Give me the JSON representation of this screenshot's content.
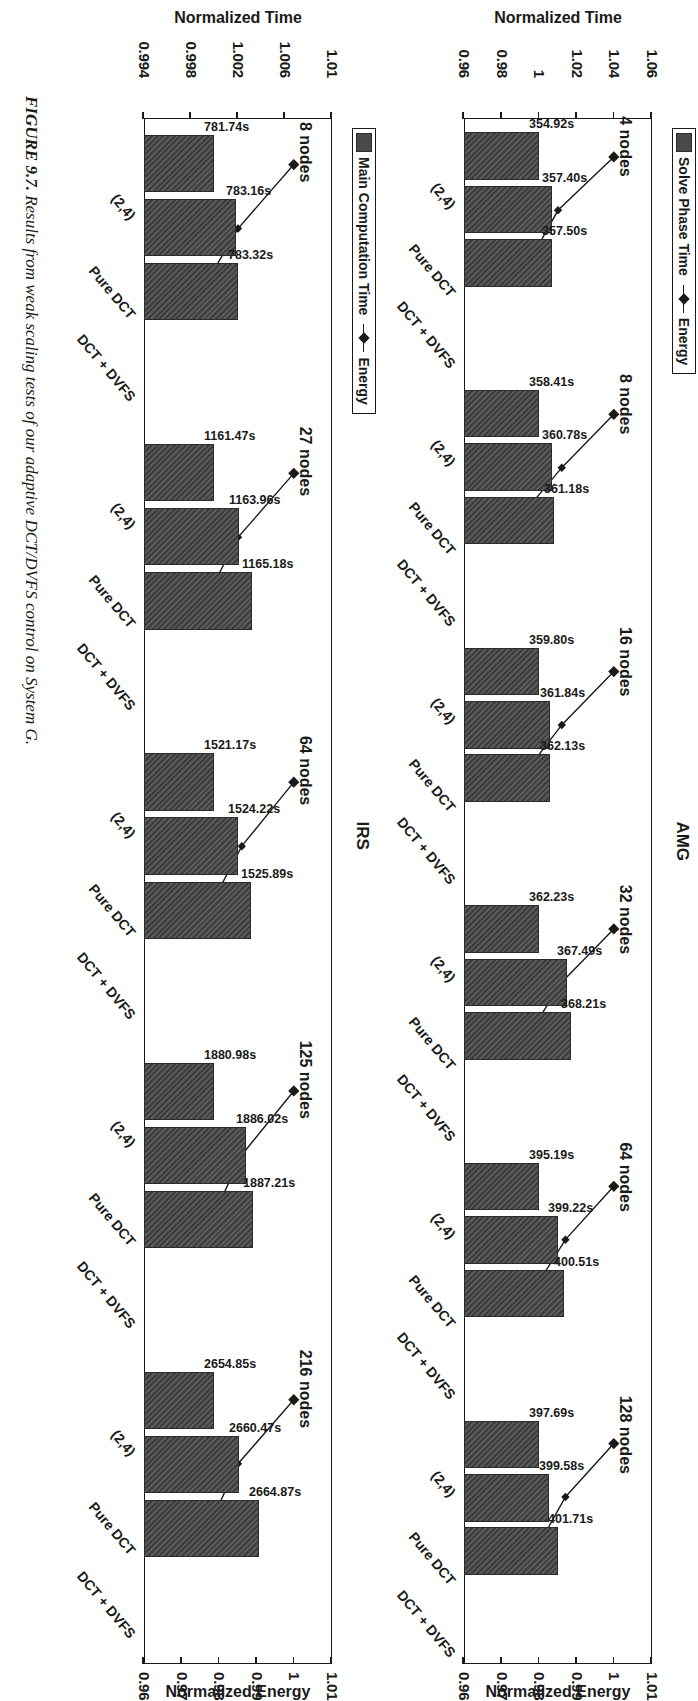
{
  "figure": {
    "number_label": "FIGURE 9.7.",
    "caption": "Results from weak scaling tests of our adaptive DCT/DVFS control on System G."
  },
  "panels": [
    {
      "id": "amg",
      "title": "AMG",
      "legend": {
        "bar_label": "Solve Phase Time",
        "line_label": "Energy"
      },
      "left_axis": {
        "title": "Normalized Time",
        "ticks": [
          "1.06",
          "1.04",
          "1.02",
          "1",
          "0.98",
          "0.96"
        ]
      },
      "right_axis": {
        "title": "Normalized Energy",
        "ticks": [
          "1.01",
          "1",
          "0.99",
          "0.98",
          "0.97",
          "0.96"
        ]
      },
      "categories": [
        "(2,4)",
        "Pure DCT",
        "DCT + DVFS"
      ],
      "groups": [
        {
          "label": "4 nodes",
          "bar_labels": [
            "354.92s",
            "357.40s",
            "357.50s"
          ]
        },
        {
          "label": "8 nodes",
          "bar_labels": [
            "358.41s",
            "360.78s",
            "361.18s"
          ]
        },
        {
          "label": "16 nodes",
          "bar_labels": [
            "359.80s",
            "361.84s",
            "362.13s"
          ]
        },
        {
          "label": "32 nodes",
          "bar_labels": [
            "362.23s",
            "367.49s",
            "368.21s"
          ]
        },
        {
          "label": "64 nodes",
          "bar_labels": [
            "395.19s",
            "399.22s",
            "400.51s"
          ]
        },
        {
          "label": "128 nodes",
          "bar_labels": [
            "397.69s",
            "399.58s",
            "401.71s"
          ]
        }
      ]
    },
    {
      "id": "irs",
      "title": "IRS",
      "legend": {
        "bar_label": "Main Computation Time",
        "line_label": "Energy"
      },
      "left_axis": {
        "title": "Normalized Time",
        "ticks": [
          "1.01",
          "1.006",
          "1.002",
          "0.998",
          "0.994"
        ]
      },
      "right_axis": {
        "title": "Normalized Energy",
        "ticks": [
          "1.01",
          "1",
          "0.99",
          "0.98",
          "0.97",
          "0.96"
        ]
      },
      "categories": [
        "(2,4)",
        "Pure DCT",
        "DCT + DVFS"
      ],
      "groups": [
        {
          "label": "8 nodes",
          "bar_labels": [
            "781.74s",
            "783.16s",
            "783.32s"
          ]
        },
        {
          "label": "27 nodes",
          "bar_labels": [
            "1161.47s",
            "1163.96s",
            "1165.18s"
          ]
        },
        {
          "label": "64 nodes",
          "bar_labels": [
            "1521.17s",
            "1524.22s",
            "1525.89s"
          ]
        },
        {
          "label": "125 nodes",
          "bar_labels": [
            "1880.98s",
            "1886.02s",
            "1887.21s"
          ]
        },
        {
          "label": "216 nodes",
          "bar_labels": [
            "2654.85s",
            "2660.47s",
            "2664.87s"
          ]
        }
      ]
    }
  ],
  "colors": {
    "bar_fill": "#4a4a4a",
    "line": "#1a1a1a",
    "frame": "#1a1a1a"
  },
  "chart_data": [
    {
      "type": "bar",
      "id": "amg",
      "title": "AMG",
      "xlabel": "",
      "ylabel": "Normalized Time",
      "y2label": "Normalized Energy",
      "ylim": [
        0.96,
        1.06
      ],
      "y2lim": [
        0.96,
        1.01
      ],
      "yticks": [
        1.06,
        1.04,
        1.02,
        1,
        0.98,
        0.96
      ],
      "y2ticks": [
        1.01,
        1,
        0.99,
        0.98,
        0.97,
        0.96
      ],
      "grid": false,
      "legend_position": "top-left",
      "categories": [
        "(2,4)",
        "Pure DCT",
        "DCT + DVFS"
      ],
      "groups": [
        "4 nodes",
        "8 nodes",
        "16 nodes",
        "32 nodes",
        "64 nodes",
        "128 nodes"
      ],
      "series": [
        {
          "name": "Solve Phase Time",
          "kind": "bar",
          "axis": "left",
          "units": "normalized",
          "values": [
            [
              1.0,
              1.007,
              1.007
            ],
            [
              1.0,
              1.007,
              1.008
            ],
            [
              1.0,
              1.006,
              1.006
            ],
            [
              1.0,
              1.015,
              1.017
            ],
            [
              1.0,
              1.01,
              1.013
            ],
            [
              1.0,
              1.005,
              1.01
            ]
          ],
          "raw_seconds": [
            [
              354.92,
              357.4,
              357.5
            ],
            [
              358.41,
              360.78,
              361.18
            ],
            [
              359.8,
              361.84,
              362.13
            ],
            [
              362.23,
              367.49,
              368.21
            ],
            [
              395.19,
              399.22,
              400.51
            ],
            [
              397.69,
              399.58,
              401.71
            ]
          ],
          "data_labels": [
            [
              "354.92s",
              "357.40s",
              "357.50s"
            ],
            [
              "358.41s",
              "360.78s",
              "361.18s"
            ],
            [
              "359.80s",
              "361.84s",
              "362.13s"
            ],
            [
              "362.23s",
              "367.49s",
              "368.21s"
            ],
            [
              "395.19s",
              "399.22s",
              "400.51s"
            ],
            [
              "397.69s",
              "399.58s",
              "401.71s"
            ]
          ]
        },
        {
          "name": "Energy",
          "kind": "line",
          "axis": "right",
          "marker": "diamond",
          "values": [
            [
              1.0,
              0.985,
              0.977
            ],
            [
              1.0,
              0.986,
              0.974
            ],
            [
              1.0,
              0.986,
              0.975
            ],
            [
              1.0,
              0.986,
              0.977
            ],
            [
              1.0,
              0.987,
              0.978
            ],
            [
              1.0,
              0.987,
              0.979
            ]
          ]
        }
      ]
    },
    {
      "type": "bar",
      "id": "irs",
      "title": "IRS",
      "xlabel": "",
      "ylabel": "Normalized Time",
      "y2label": "Normalized Energy",
      "ylim": [
        0.994,
        1.01
      ],
      "y2lim": [
        0.96,
        1.01
      ],
      "yticks": [
        1.01,
        1.006,
        1.002,
        0.998,
        0.994
      ],
      "y2ticks": [
        1.01,
        1,
        0.99,
        0.98,
        0.97,
        0.96
      ],
      "grid": false,
      "legend_position": "top-left",
      "categories": [
        "(2,4)",
        "Pure DCT",
        "DCT + DVFS"
      ],
      "groups": [
        "8 nodes",
        "27 nodes",
        "64 nodes",
        "125 nodes",
        "216 nodes"
      ],
      "series": [
        {
          "name": "Main Computation Time",
          "kind": "bar",
          "axis": "left",
          "units": "normalized",
          "values": [
            [
              1.0,
              1.0018,
              1.002
            ],
            [
              1.0,
              1.0021,
              1.0032
            ],
            [
              1.0,
              1.002,
              1.0031
            ],
            [
              1.0,
              1.0027,
              1.0033
            ],
            [
              1.0,
              1.0021,
              1.0038
            ]
          ],
          "raw_seconds": [
            [
              781.74,
              783.16,
              783.32
            ],
            [
              1161.47,
              1163.96,
              1165.18
            ],
            [
              1521.17,
              1524.22,
              1525.89
            ],
            [
              1880.98,
              1886.02,
              1887.21
            ],
            [
              2654.85,
              2660.47,
              2664.87
            ]
          ],
          "data_labels": [
            [
              "781.74s",
              "783.16s",
              "783.32s"
            ],
            [
              "1161.47s",
              "1163.96s",
              "1165.18s"
            ],
            [
              "1521.17s",
              "1524.22s",
              "1525.89s"
            ],
            [
              "1880.98s",
              "1886.02s",
              "1887.21s"
            ],
            [
              "2654.85s",
              "2660.47s",
              "2664.87s"
            ]
          ]
        },
        {
          "name": "Energy",
          "kind": "line",
          "axis": "right",
          "marker": "diamond",
          "values": [
            [
              1.0,
              0.985,
              0.975
            ],
            [
              1.0,
              0.985,
              0.976
            ],
            [
              1.0,
              0.986,
              0.977
            ],
            [
              1.0,
              0.986,
              0.978
            ],
            [
              1.0,
              0.985,
              0.977
            ]
          ]
        }
      ]
    }
  ]
}
